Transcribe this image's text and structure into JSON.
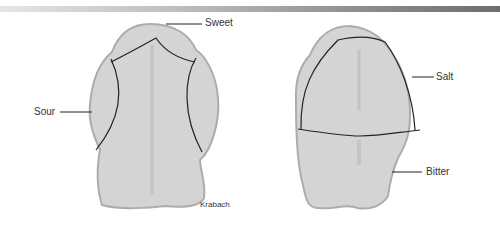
{
  "figure": {
    "left_tongue": {
      "regions": [
        "Sweet",
        "Sour"
      ],
      "labels": {
        "sweet": "Sweet",
        "sour": "Sour"
      },
      "credit": "Krabach"
    },
    "right_tongue": {
      "regions": [
        "Salt",
        "Bitter"
      ],
      "labels": {
        "salt": "Salt",
        "bitter": "Bitter"
      }
    },
    "colors": {
      "tongue_fill": "#d4d4d4",
      "tongue_edge": "#a8a8a8",
      "line": "#222222",
      "text": "#333333"
    }
  }
}
